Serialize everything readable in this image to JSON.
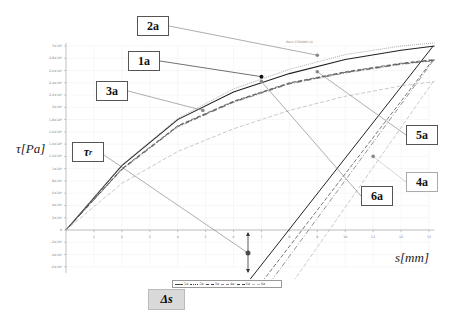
{
  "chart_data": {
    "type": "line",
    "title": "",
    "xlabel": "s[mm]",
    "ylabel": "τ[Pa]",
    "xlim": [
      0,
      13
    ],
    "ylim": [
      -600000,
      3000000
    ],
    "x_ticks": [
      "1",
      "2",
      "3",
      "4",
      "5",
      "6",
      "7",
      "8",
      "9",
      "10",
      "11",
      "12",
      "13"
    ],
    "y_ticks": [
      "3×10⁶",
      "2.8×10⁶",
      "2.6×10⁶",
      "2.4×10⁶",
      "2.2×10⁶",
      "2×10⁶",
      "1.8×10⁶",
      "1.6×10⁶",
      "1.4×10⁶",
      "1.2×10⁶",
      "1×10⁶",
      "8×10⁵",
      "6×10⁵",
      "4×10⁵",
      "2×10⁵",
      "0",
      "-2×10⁵",
      "-4×10⁵",
      "-6×10⁵"
    ],
    "grid": true,
    "legend_position": "bottom",
    "series": [
      {
        "name": "1a",
        "style": "solid",
        "color": "#222222",
        "x": [
          0,
          2,
          4,
          6,
          8,
          10,
          12,
          13.2
        ],
        "y": [
          0,
          1050000,
          1800000,
          2250000,
          2550000,
          2780000,
          2930000,
          3000000
        ],
        "marker": {
          "x": 7.0,
          "y": 2500000
        }
      },
      {
        "name": "2a",
        "style": "dotted",
        "color": "#999999",
        "x": [
          0,
          2,
          4,
          6,
          8,
          10,
          12,
          13.2
        ],
        "y": [
          0,
          1060000,
          1820000,
          2300000,
          2620000,
          2860000,
          3000000,
          3050000
        ],
        "marker": {
          "x": 9.0,
          "y": 2850000
        }
      },
      {
        "name": "3a",
        "style": "dashed",
        "color": "#555555",
        "x": [
          0,
          2,
          4,
          6,
          8,
          10,
          12,
          13.2
        ],
        "y": [
          0,
          1000000,
          1700000,
          2100000,
          2400000,
          2580000,
          2720000,
          2780000
        ],
        "marker": {
          "x": 4.9,
          "y": 1950000
        }
      },
      {
        "name": "4a",
        "style": "dash-dot",
        "color": "#777777",
        "x": [
          0,
          2,
          4,
          6,
          8,
          10,
          12,
          13.2
        ],
        "y": [
          0,
          980000,
          1680000,
          2080000,
          2380000,
          2560000,
          2700000,
          2760000
        ],
        "marker": {
          "x": 11.0,
          "y": 1200000
        }
      },
      {
        "name": "5a",
        "style": "long-dash",
        "color": "#444444",
        "x": [
          0,
          2,
          4,
          6,
          8,
          10,
          12,
          13.2
        ],
        "y": [
          0,
          990000,
          1690000,
          2090000,
          2390000,
          2570000,
          2710000,
          2770000
        ],
        "marker": {
          "x": 9.0,
          "y": 2580000
        }
      },
      {
        "name": "6a",
        "style": "dashed",
        "color": "#bbbbbb",
        "x": [
          0,
          2,
          4,
          6,
          8,
          10,
          12,
          13.2
        ],
        "y": [
          0,
          760000,
          1280000,
          1650000,
          1950000,
          2180000,
          2350000,
          2420000
        ],
        "marker": {
          "x": 7.0,
          "y": 2420000
        }
      }
    ],
    "annotations": [
      "1a",
      "2a",
      "3a",
      "4a",
      "5a",
      "6a",
      "τr",
      "Δs"
    ]
  },
  "labels": {
    "l1a": "1a",
    "l2a": "2a",
    "l3a": "3a",
    "l4a": "4a",
    "l5a": "5a",
    "l6a": "6a",
    "tau_r": "τ",
    "tau_r_sub": "r",
    "delta_s": "Δs",
    "ylabel": "τ[Pa]",
    "xlabel": "s[mm]",
    "top_note": "Revit 3700000 (4)"
  },
  "legend": [
    {
      "label": "1a"
    },
    {
      "label": "2a"
    },
    {
      "label": "3a"
    },
    {
      "label": "4a"
    },
    {
      "label": "5a"
    },
    {
      "label": "6a"
    }
  ]
}
